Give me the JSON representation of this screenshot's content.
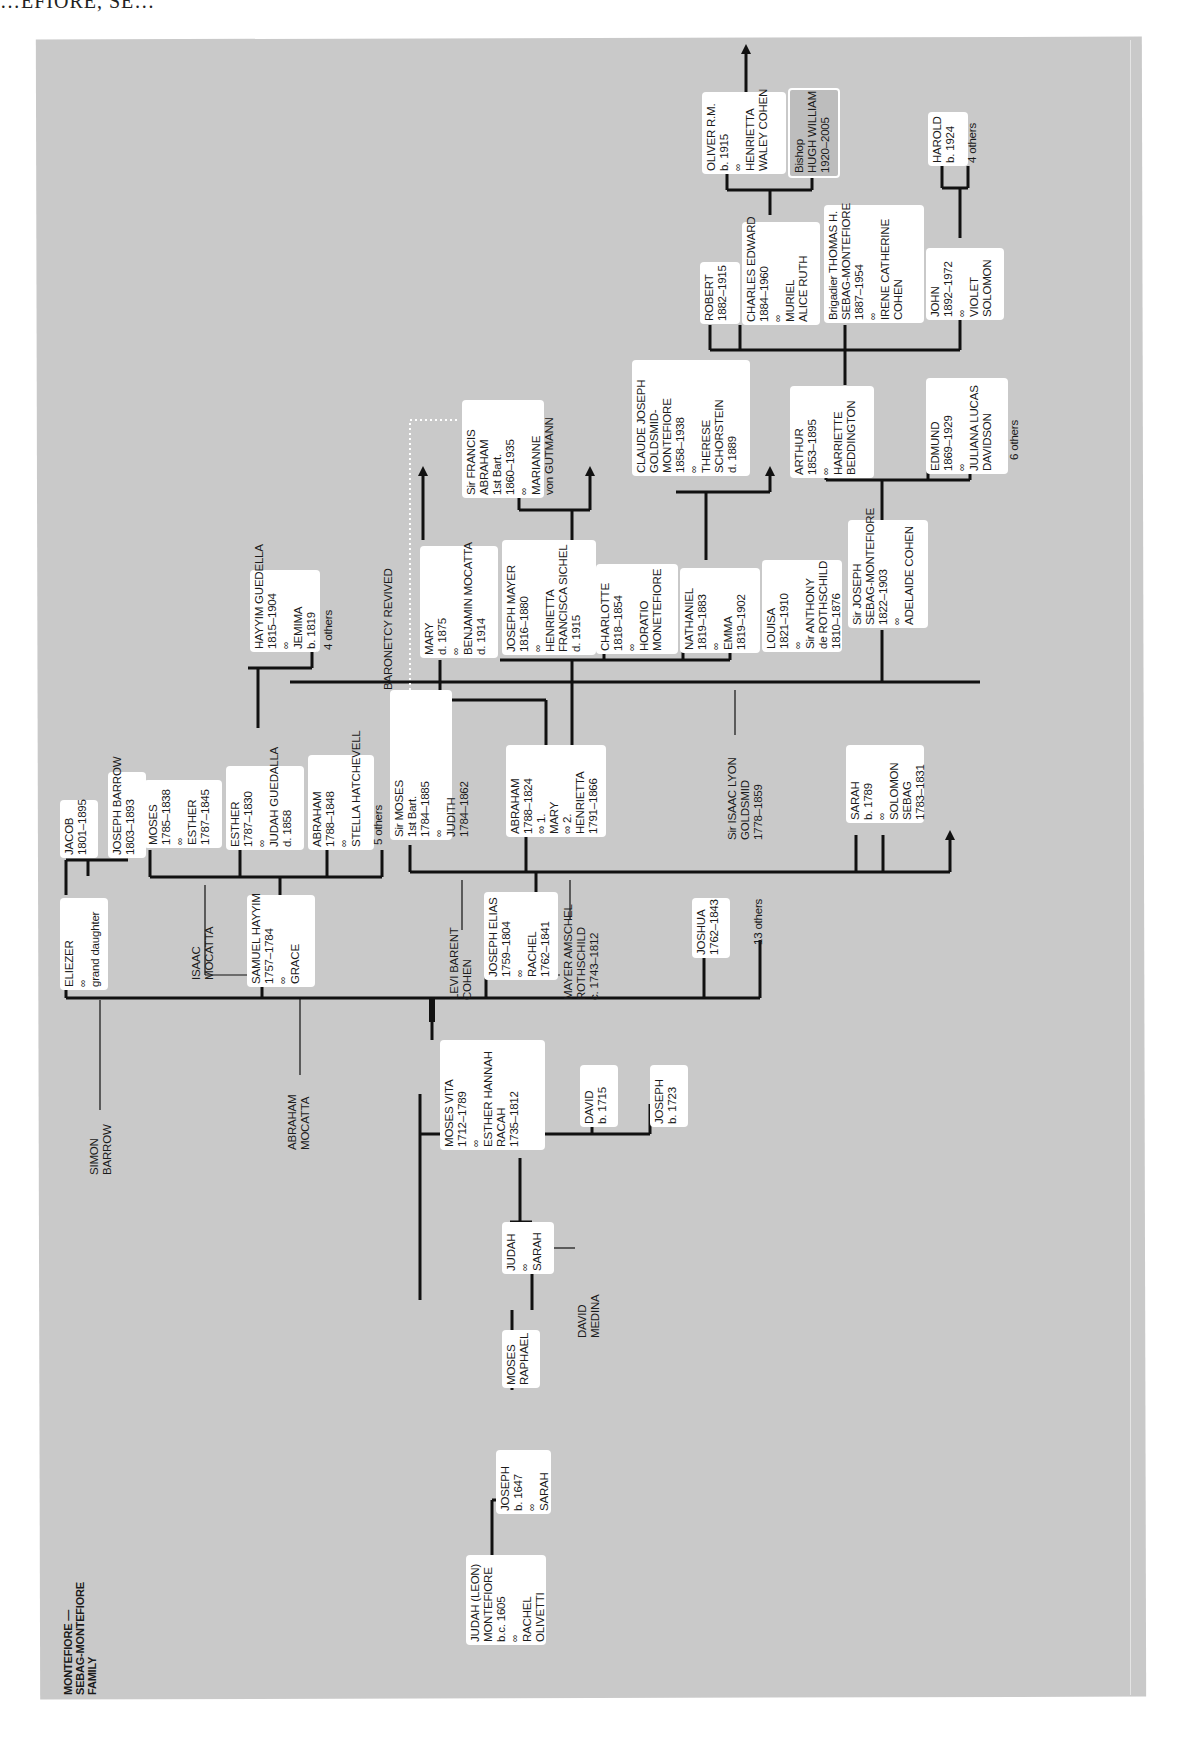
{
  "page_header": "…EFIORE, SE…",
  "diagram": {
    "title_lines": [
      "MONTEFIORE —",
      "SEBAG-MONTEFIORE",
      "FAMILY"
    ],
    "marriage_symbol": "ↀ",
    "annotations": {
      "baronetcy": "BARONETCY REVIVED"
    },
    "people": {
      "judah_leon": [
        "JUDAH (LEON)",
        "MONTEFIORE",
        "b.c. 1605",
        "∞",
        "RACHEL",
        "OLIVETTI"
      ],
      "joseph_1647": [
        "JOSEPH",
        "b. 1647",
        "∞",
        "SARAH"
      ],
      "moses_raphael": [
        "MOSES",
        "RAPHAEL"
      ],
      "judah_sarah": [
        "JUDAH",
        "∞",
        "SARAH"
      ],
      "david_medina": [
        "DAVID",
        "MEDINA"
      ],
      "moses_vita": [
        "MOSES VITA",
        "1712–1789",
        "∞",
        "ESTHER HANNAH",
        "RACAH",
        "1735–1812"
      ],
      "david_1715": [
        "DAVID",
        "b. 1715"
      ],
      "joseph_1723": [
        "JOSEPH",
        "b. 1723"
      ],
      "simon_barrow": [
        "SIMON",
        "BARROW"
      ],
      "abraham_mocatta": [
        "ABRAHAM",
        "MOCATTA"
      ],
      "eliezer": [
        "ELIEZER",
        "∞",
        "grand daughter"
      ],
      "isaac_mocatta": [
        "ISAAC",
        "MOCATTA"
      ],
      "samuel_hayyim": [
        "SAMUEL HAYYIM",
        "1757–1784",
        "∞",
        "GRACE"
      ],
      "levi_barent": [
        "LEVI BARENT",
        "COHEN"
      ],
      "joseph_elias": [
        "JOSEPH ELIAS",
        "1759–1804",
        "∞",
        "RACHEL",
        "1762–1841"
      ],
      "mayer_amschel": [
        "MAYER AMSCHEL",
        "ROTHSCHILD",
        "c. 1743–1812"
      ],
      "joshua": [
        "JOSHUA",
        "1762–1843"
      ],
      "thirteen_others": [
        "13 others"
      ],
      "jacob": [
        "JACOB",
        "1801–1895"
      ],
      "joseph_barrow": [
        "JOSEPH BARROW",
        "1803–1893"
      ],
      "moses_1785": [
        "MOSES",
        "1785–1838",
        "∞",
        "ESTHER",
        "1787–1845"
      ],
      "esther_1787": [
        "ESTHER",
        "1787–1830",
        "∞",
        "JUDAH GUEDALLA",
        "d. 1858"
      ],
      "abraham_1788": [
        "ABRAHAM",
        "1788–1848",
        "∞",
        "STELLA HATCHEVELL"
      ],
      "five_others": [
        "5 others"
      ],
      "sir_moses": [
        "Sir MOSES",
        "1st Bart.",
        "1784–1885",
        "∞",
        "JUDITH",
        "1784–1862"
      ],
      "abraham_1788_1824": [
        "ABRAHAM",
        "1788–1824",
        "∞ 1.",
        "MARY",
        "∞ 2.",
        "HENRIETTA",
        "1791–1866"
      ],
      "isaac_lyon": [
        "Sir ISAAC LYON",
        "GOLDSMID",
        "1778–1859"
      ],
      "sarah_1789": [
        "SARAH",
        "b. 1789",
        "∞",
        "SOLOMON",
        "SEBAG",
        "1783–1831"
      ],
      "hayyim_guedella": [
        "HAYYIM GUEDELLA",
        "1815–1904",
        "∞",
        "JEMIMA",
        "b. 1819"
      ],
      "four_others_a": [
        "4 others"
      ],
      "mary_1875": [
        "MARY",
        "d. 1875",
        "∞",
        "BENJAMIN MOCATTA",
        "d. 1914"
      ],
      "joseph_mayer": [
        "JOSEPH MAYER",
        "1816–1880",
        "∞",
        "HENRIETTA",
        "FRANCISCA SICHEL",
        "d. 1915"
      ],
      "charlotte": [
        "CHARLOTTE",
        "1818–1854",
        "∞",
        "HORATIO",
        "MONETEFIORE"
      ],
      "nathaniel": [
        "NATHANIEL",
        "1819–1883",
        "∞",
        "EMMA",
        "1819–1902"
      ],
      "louisa": [
        "LOUISA",
        "1821–1910",
        "∞",
        "Sir ANTHONY",
        "de ROTHSCHILD",
        "1810–1876"
      ],
      "sir_joseph": [
        "Sir JOSEPH",
        "SEBAG-MONTEFIORE",
        "1822–1903",
        "∞",
        "ADELAIDE COHEN"
      ],
      "sir_francis": [
        "Sir FRANCIS",
        "ABRAHAM",
        "1st Bart.",
        "1860–1935",
        "∞",
        "MARIANNE",
        "von GUTMANN"
      ],
      "claude_joseph": [
        "CLAUDE JOSEPH",
        "GOLDSMID-",
        "MONTEFIORE",
        "1858–1938",
        "∞",
        "THERESE",
        "SCHORSTEIN",
        "d. 1889"
      ],
      "arthur": [
        "ARTHUR",
        "1853–1895",
        "∞",
        "HARRIETTE",
        "BEDDINGTON"
      ],
      "edmund": [
        "EDMUND",
        "1869–1929",
        "∞",
        "JULIANA LUCAS",
        "DAVIDSON"
      ],
      "six_others": [
        "6 others"
      ],
      "robert": [
        "ROBERT",
        "1882–1915"
      ],
      "charles_edward": [
        "CHARLES EDWARD",
        "1884–1960",
        "∞",
        "MURIEL",
        "ALICE RUTH"
      ],
      "brigadier_thomas": [
        "Brigadier THOMAS H.",
        "SEBAG-MONTEFIORE",
        "1887–1954",
        "∞",
        "IRENE CATHERINE",
        "COHEN"
      ],
      "john": [
        "JOHN",
        "1892–1972",
        "∞",
        "VIOLET",
        "SOLOMON"
      ],
      "oliver": [
        "OLIVER R.M.",
        "b. 1915",
        "∞",
        "HENRIETTA",
        "WALEY COHEN"
      ],
      "bishop_hugh": [
        "Bishop",
        "HUGH WILLIAM",
        "1920–2005"
      ],
      "harold": [
        "HAROLD",
        "b. 1924"
      ],
      "four_others_b": [
        "4 others"
      ]
    },
    "colors": {
      "panel": "#c9c9c9",
      "box": "#ffffff",
      "line": "#111111",
      "highlight_box": "#bdbdbd"
    }
  }
}
